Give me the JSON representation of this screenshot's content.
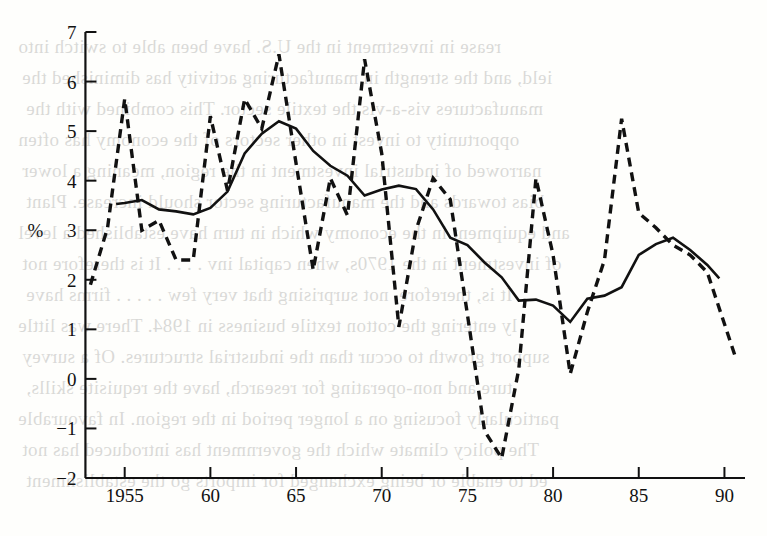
{
  "figure": {
    "background_color": "#fefefc",
    "ink_color": "#111111",
    "y_axis_title": "%",
    "bleed_text": [
      "rease in investment in the U.S. have been able to switch into",
      "ield, and the strength in manufacturing activity has diminished the",
      "manufactures vis-a-vis the textile sector. This combined with the",
      "opportunity to invest in other sectors of the economy has often",
      "narrowed of industrial investment in the region, meaning a lower",
      "bias towards and the manufacturing sector should increase. Plant",
      "and equipment in the economy which in turn have established a level",
      "of investment in the 1970s, when capital inv . . . . It is therefore not",
      "   It is, therefore, not surprising that very few . . . . . firms have",
      "ly entering the cotton textile business in 1984. There was little",
      "support growth to occur than the industrial structures. Of a survey",
      "ture and non-operating for research, have the requisite skills,",
      "particularly focusing on a longer period in the region. In favourable",
      "   The policy climate which the government has introduced has not",
      "ed to enable or being exchanged for imports go the establishment"
    ]
  },
  "chart_data": {
    "type": "line",
    "title": "",
    "xlabel": "",
    "ylabel": "%",
    "xlim": [
      1952.8,
      1991.2
    ],
    "ylim": [
      -2,
      7
    ],
    "yticks": [
      -2,
      -1,
      0,
      1,
      2,
      3,
      4,
      5,
      6,
      7
    ],
    "ytick_labels": [
      "−2",
      "−1",
      "0",
      "1",
      "2",
      "3",
      "4",
      "5",
      "6",
      "7"
    ],
    "xticks": [
      1955,
      1960,
      1965,
      1970,
      1975,
      1980,
      1985,
      1990
    ],
    "xtick_labels": [
      "1955",
      "60",
      "65",
      "70",
      "75",
      "80",
      "85",
      "90"
    ],
    "grid": false,
    "legend": false,
    "series": [
      {
        "name": "solid",
        "style": "solid",
        "color": "#111111",
        "x": [
          1954.5,
          1955,
          1956,
          1957,
          1958,
          1959,
          1960,
          1961,
          1962,
          1963,
          1964,
          1965,
          1966,
          1967,
          1968,
          1969,
          1970,
          1971,
          1972,
          1973,
          1974,
          1975,
          1976,
          1977,
          1978,
          1979,
          1980,
          1981,
          1982,
          1983,
          1984,
          1985,
          1986,
          1987,
          1988,
          1989,
          1989.7
        ],
        "y": [
          3.53,
          3.55,
          3.61,
          3.42,
          3.38,
          3.32,
          3.45,
          3.78,
          4.55,
          4.95,
          5.2,
          5.05,
          4.6,
          4.3,
          4.1,
          3.7,
          3.82,
          3.9,
          3.83,
          3.42,
          2.85,
          2.7,
          2.35,
          2.05,
          1.58,
          1.6,
          1.48,
          1.15,
          1.62,
          1.68,
          1.85,
          2.5,
          2.72,
          2.85,
          2.6,
          2.3,
          2.03
        ]
      },
      {
        "name": "dashed",
        "style": "dashed",
        "color": "#111111",
        "x": [
          1953,
          1954,
          1955,
          1956,
          1957,
          1958,
          1959,
          1960,
          1961,
          1962,
          1963,
          1964,
          1965,
          1966,
          1967,
          1968,
          1969,
          1970,
          1971,
          1972,
          1973,
          1974,
          1975,
          1976,
          1977,
          1978,
          1979,
          1980,
          1981,
          1982,
          1983,
          1984,
          1985,
          1986,
          1987,
          1988,
          1989,
          1990.7
        ],
        "y": [
          1.9,
          3.05,
          5.65,
          3.0,
          3.2,
          2.4,
          2.4,
          5.3,
          3.8,
          5.65,
          5.05,
          6.55,
          4.35,
          2.2,
          4.05,
          3.3,
          6.45,
          4.55,
          1.05,
          3.0,
          4.05,
          3.62,
          1.3,
          -1.05,
          -1.6,
          0.2,
          4.05,
          2.5,
          0.1,
          1.35,
          2.4,
          5.25,
          3.35,
          3.05,
          2.7,
          2.5,
          2.15,
          0.38
        ]
      }
    ]
  }
}
